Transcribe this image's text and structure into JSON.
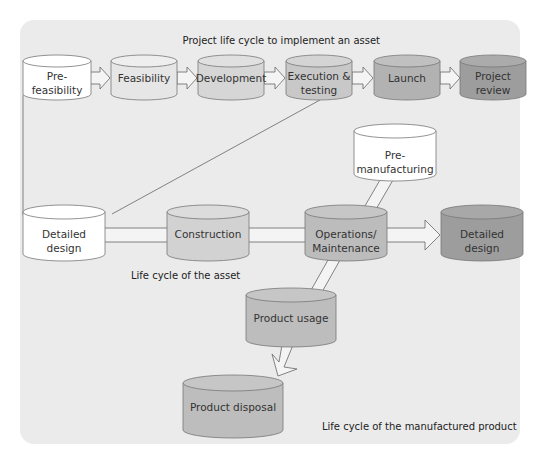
{
  "diagram": {
    "captions": {
      "project": "Project life cycle to implement an asset",
      "asset": "Life cycle of the asset",
      "product": "Life cycle of the manufactured product"
    },
    "nodes": {
      "pre_feasibility": {
        "line1": "Pre-",
        "line2": "feasibility",
        "color": "#ffffff"
      },
      "feasibility": {
        "line1": "Feasibility",
        "color": "#e6e6e6"
      },
      "development": {
        "line1": "Development",
        "color": "#d6d6d6"
      },
      "execution": {
        "line1": "Execution &",
        "line2": "testing",
        "color": "#c8c8c8"
      },
      "launch": {
        "line1": "Launch",
        "color": "#b2b2b2"
      },
      "project_review": {
        "line1": "Project",
        "line2": "review",
        "color": "#9d9d9d"
      },
      "pre_manufacturing": {
        "line1": "Pre-",
        "line2": "manufacturing",
        "color": "#ffffff"
      },
      "detailed_design_left": {
        "line1": "Detailed",
        "line2": "design",
        "color": "#ffffff"
      },
      "construction": {
        "line1": "Construction",
        "color": "#d2d2d2"
      },
      "operations": {
        "line1": "Operations/",
        "line2": "Maintenance",
        "color": "#bcbcbc"
      },
      "detailed_design_right": {
        "line1": "Detailed",
        "line2": "design",
        "color": "#9d9d9d"
      },
      "product_usage": {
        "line1": "Product usage",
        "color": "#bdbdbd"
      },
      "product_disposal": {
        "line1": "Product disposal",
        "color": "#bdbdbd"
      }
    }
  }
}
